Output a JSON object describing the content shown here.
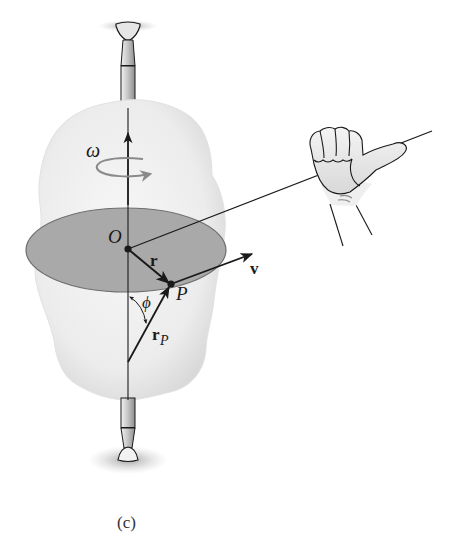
{
  "figure": {
    "caption": "(c)",
    "labels": {
      "omega": "ω",
      "origin": "O",
      "r": "r",
      "point": "P",
      "v": "v",
      "phi": "ϕ",
      "rP_main": "r",
      "rP_sub": "P"
    },
    "colors": {
      "background": "#ffffff",
      "body_fill": "#ececec",
      "body_edge": "#d6d6d6",
      "disk_fill": "#a9a9a9",
      "disk_edge": "#6e6e6e",
      "ink": "#1a1a1a",
      "rotation_arrow": "#8a8a8a",
      "shaft_fill": "#c8c8c8",
      "skin": "#f0f0f0"
    }
  }
}
